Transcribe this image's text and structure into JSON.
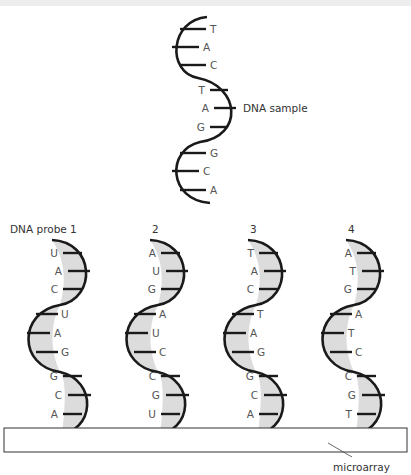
{
  "figure": {
    "sample": {
      "label": "DNA sample",
      "bases": [
        "T",
        "A",
        "C",
        "T",
        "A",
        "G",
        "G",
        "C",
        "A"
      ]
    },
    "probes": [
      {
        "label": "DNA probe 1",
        "bases": [
          "U",
          "A",
          "C",
          "U",
          "A",
          "G",
          "G",
          "C",
          "A"
        ]
      },
      {
        "label": "2",
        "bases": [
          "A",
          "U",
          "G",
          "A",
          "U",
          "C",
          "C",
          "G",
          "U"
        ]
      },
      {
        "label": "3",
        "bases": [
          "T",
          "A",
          "C",
          "T",
          "A",
          "G",
          "G",
          "C",
          "A"
        ]
      },
      {
        "label": "4",
        "bases": [
          "A",
          "T",
          "G",
          "A",
          "T",
          "C",
          "C",
          "G",
          "T"
        ]
      }
    ],
    "microarray_label": "microarray",
    "colors": {
      "strand": "#1a1a1a",
      "fill": "#e0e0e0",
      "text": "#444444",
      "top_strip": "#ededed"
    }
  }
}
